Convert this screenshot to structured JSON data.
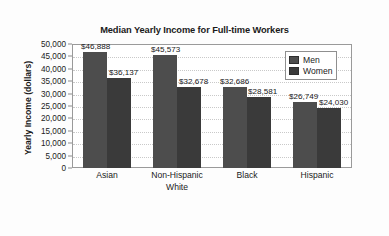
{
  "chart_data": {
    "type": "bar",
    "title": "Median Yearly Income for Full-time Workers",
    "xlabel": "",
    "ylabel": "Yearly Income (dollars)",
    "ylim": [
      0,
      50000
    ],
    "ytick_step": 5000,
    "grid": true,
    "legend_position": "top-right",
    "categories": [
      "Asian",
      "Non-Hispanic White",
      "Black",
      "Hispanic"
    ],
    "category_lines": [
      [
        "Asian"
      ],
      [
        "Non-Hispanic",
        "White"
      ],
      [
        "Black"
      ],
      [
        "Hispanic"
      ]
    ],
    "ytick_labels": [
      "50,000",
      "45,000",
      "40,000",
      "35,000",
      "30,000",
      "25,000",
      "20,000",
      "15,000",
      "10,000",
      "5,000",
      "0"
    ],
    "ytick_values": [
      50000,
      45000,
      40000,
      35000,
      30000,
      25000,
      20000,
      15000,
      10000,
      5000,
      0
    ],
    "series": [
      {
        "name": "Men",
        "color": "#4d4d4d",
        "values": [
          46888,
          45573,
          32686,
          26749
        ],
        "data_labels": [
          "$46,888",
          "$45,573",
          "$32,686",
          "$26,749"
        ]
      },
      {
        "name": "Women",
        "color": "#3a3a3a",
        "values": [
          36137,
          32678,
          28581,
          24030
        ],
        "data_labels": [
          "$36,137",
          "$32,678",
          "$28,581",
          "$24,030"
        ]
      }
    ]
  },
  "legend": {
    "items": [
      {
        "label": "Men",
        "color": "#4d4d4d"
      },
      {
        "label": "Women",
        "color": "#3a3a3a"
      }
    ]
  }
}
